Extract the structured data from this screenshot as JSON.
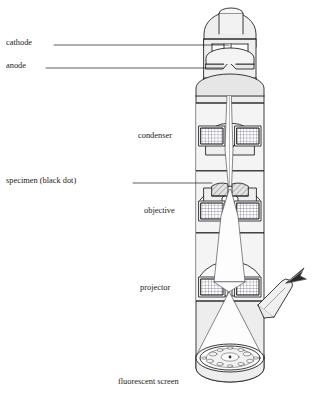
{
  "figure": {
    "background_color": "#ffffff",
    "outline_color": "#1a1a1a",
    "body_fill": "#eeeeee",
    "chamber_fill": "#f7f7f7",
    "beam_fill": "#fbfbfb",
    "coil_fill": "#ffffff",
    "hatch_fill": "#d8d8d8"
  },
  "labels": {
    "cathode": "cathode",
    "anode": "anode",
    "condenser": "condenser",
    "specimen": "specimen (black dot)",
    "objective": "objective",
    "projector": "projector",
    "screen": "fluorescent screen"
  },
  "parts": {
    "electron_gun": "electron-gun",
    "cathode_filament": "cathode-filament",
    "anode_plate": "anode-plate",
    "condenser_lens": "condenser-lens",
    "specimen_stage": "specimen-stage",
    "objective_lens": "objective-lens",
    "projector_lens": "projector-lens",
    "viewing_tube": "viewing-tube",
    "eye_symbol": "eye-symbol",
    "fluorescent_screen": "fluorescent-screen",
    "electron_beam": "electron-beam"
  }
}
